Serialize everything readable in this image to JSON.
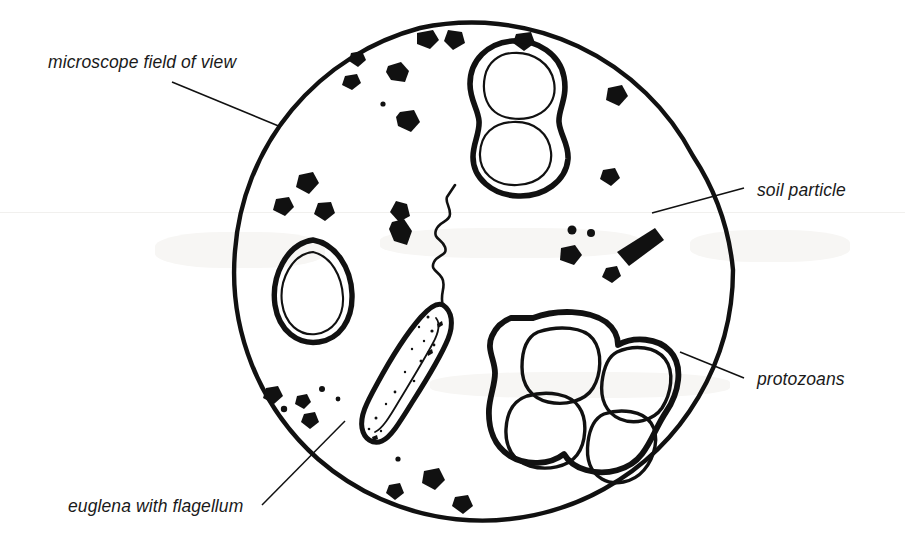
{
  "figure": {
    "background_color": "#ffffff",
    "ink_color": "#111111",
    "field": {
      "shape": "circle",
      "center_x": 483,
      "center_y": 270,
      "radius": 250,
      "stroke_width": 4.2
    }
  },
  "labels": [
    {
      "id": "microscope-field-of-view",
      "text": "microscope field of view",
      "text_x": 48,
      "text_y": 68,
      "anchor": "start",
      "leader": {
        "x1": 172,
        "y1": 82,
        "x2": 281,
        "y2": 127
      }
    },
    {
      "id": "soil-particle",
      "text": "soil particle",
      "text_x": 757,
      "text_y": 196,
      "anchor": "start",
      "leader": {
        "x1": 744,
        "y1": 188,
        "x2": 652,
        "y2": 213
      }
    },
    {
      "id": "protozoans",
      "text": "protozoans",
      "text_x": 757,
      "text_y": 385,
      "anchor": "start",
      "leader": {
        "x1": 744,
        "y1": 378,
        "x2": 680,
        "y2": 352
      }
    },
    {
      "id": "euglena-with-flagellum",
      "text": "euglena with flagellum",
      "text_x": 68,
      "text_y": 512,
      "anchor": "start",
      "leader": {
        "x1": 262,
        "y1": 505,
        "x2": 345,
        "y2": 421
      }
    }
  ],
  "organisms": [
    {
      "id": "protozoan-dividing-pair",
      "kind": "protozoan",
      "description": "figure-eight dividing cell with two lobes, thick wall and thin inner membrane",
      "position": {
        "x": 512,
        "y": 110
      }
    },
    {
      "id": "protozoan-single-oval",
      "kind": "protozoan",
      "description": "single teardrop shaped cell, thick wall and thin inner membrane",
      "position": {
        "x": 312,
        "y": 292
      }
    },
    {
      "id": "protozoan-quad-cluster",
      "kind": "protozoan",
      "description": "cluster of four rounded cells in a common thick envelope",
      "position": {
        "x": 580,
        "y": 398
      }
    },
    {
      "id": "euglena",
      "kind": "euglena",
      "description": "elongated spindle body with stippled interior and a long wavy flagellum",
      "position": {
        "x": 405,
        "y": 370
      }
    }
  ],
  "soil_particles": {
    "description": "irregular solid black angular grains scattered through the field",
    "count": 30
  }
}
